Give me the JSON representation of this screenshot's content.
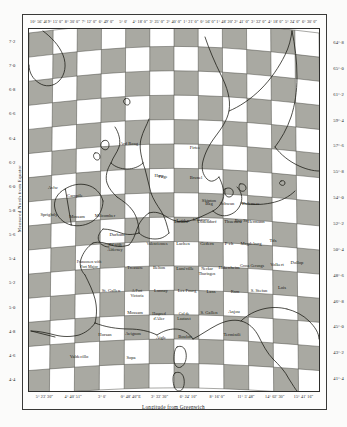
{
  "map": {
    "title": "Checkerboard graticule map of Western Europe",
    "projection_note": "curved graticule plate",
    "bottom_axis_caption": "Longitude from Greenwich",
    "left_axis_caption": "Measured North from Equator",
    "grid": {
      "columns": 12,
      "rows": 15,
      "checker": true
    },
    "colors": {
      "checker_fill": "#9a9a92",
      "coastline": "#15150f",
      "graticule": "#3d3d36",
      "paper": "#fdfdfc"
    }
  },
  "axes": {
    "top_ticks": [
      "10° 56' 40\"",
      "9° 15' 0\"",
      "8° 30' 0\"",
      "7° 12' 0\"",
      "6° 49' 0\"",
      "5° 0'",
      "4° 18' 0\"",
      "3° 25' 0\"",
      "2° 40' 0\"",
      "1° 21' 0\"",
      "0° 56' 0\"",
      "1° 48' 20\"",
      "2° 41' 0\"",
      "3° 32' 0\"",
      "4° 18' 0\"",
      "5° 24' 0\"",
      "6° 30' 0\""
    ],
    "bottom_ticks": [
      "5° 23' 30\"",
      "4° 40' 51\"",
      "3° 0'",
      "0° 48' 40\"E",
      "3° 33' 30\"",
      "6° 24' 10\"",
      "8° 16' 0\"",
      "11° 5' 48\"",
      "14° 02' 30\"",
      "15° 41' 16\""
    ],
    "left_ticks": [
      "7·2",
      "7·0",
      "6·8",
      "6·6",
      "6·4",
      "6·2",
      "6·0",
      "5·8",
      "5·6",
      "5·4",
      "5·2",
      "5·0",
      "4·8",
      "4·6",
      "4·4"
    ],
    "right_ticks": [
      "64°·8",
      "65°·0",
      "61°·2",
      "59°·4",
      "57°·6",
      "55°·8",
      "54°·0",
      "52°·2",
      "50°·4",
      "48°·6",
      "46°·8",
      "45°·0",
      "43°·2",
      "41°·4"
    ]
  },
  "places": [
    {
      "name": "Ard Roag",
      "x": 100,
      "y": 116
    },
    {
      "name": "Firtee",
      "x": 166,
      "y": 120
    },
    {
      "name": "Harp",
      "x": 130,
      "y": 148
    },
    {
      "name": "Fage",
      "x": 134,
      "y": 149
    },
    {
      "name": "Brunel",
      "x": 167,
      "y": 150
    },
    {
      "name": "Avlw",
      "x": 24,
      "y": 160
    },
    {
      "name": "Carnpile",
      "x": 46,
      "y": 168
    },
    {
      "name": "Skipton",
      "x": 180,
      "y": 173
    },
    {
      "name": "Sprightly",
      "x": 20,
      "y": 187
    },
    {
      "name": "Mossam",
      "x": 48,
      "y": 189
    },
    {
      "name": "Milcomber",
      "x": 76,
      "y": 188
    },
    {
      "name": "Jekktrow",
      "x": 172,
      "y": 192
    },
    {
      "name": "Bay St",
      "x": 212,
      "y": 193
    },
    {
      "name": "Leiden",
      "x": 154,
      "y": 193
    },
    {
      "name": "Bag",
      "x": 180,
      "y": 176
    },
    {
      "name": "Schwan",
      "x": 198,
      "y": 176
    },
    {
      "name": "Delemere",
      "x": 222,
      "y": 176
    },
    {
      "name": "Lachen",
      "x": 152,
      "y": 194
    },
    {
      "name": "Oldendorf",
      "x": 178,
      "y": 194
    },
    {
      "name": "Thuessen",
      "x": 204,
      "y": 194
    },
    {
      "name": "Hermann",
      "x": 227,
      "y": 194
    },
    {
      "name": "Durham",
      "x": 88,
      "y": 207
    },
    {
      "name": "Hd with Alderney",
      "x": 86,
      "y": 217
    },
    {
      "name": "Valenciennes",
      "x": 128,
      "y": 216
    },
    {
      "name": "Lachen",
      "x": 154,
      "y": 216
    },
    {
      "name": "Gedern",
      "x": 178,
      "y": 216
    },
    {
      "name": "P·ch",
      "x": 200,
      "y": 216
    },
    {
      "name": "Magdeburg",
      "x": 222,
      "y": 216
    },
    {
      "name": "Tds",
      "x": 244,
      "y": 213
    },
    {
      "name": "Franzosen with Port Major",
      "x": 60,
      "y": 234
    },
    {
      "name": "Treasure",
      "x": 106,
      "y": 240
    },
    {
      "name": "Belton",
      "x": 130,
      "y": 240
    },
    {
      "name": "Lunéville",
      "x": 156,
      "y": 241
    },
    {
      "name": "Neckar Thuringen",
      "x": 178,
      "y": 241
    },
    {
      "name": "Hakenheim",
      "x": 200,
      "y": 240
    },
    {
      "name": "Gross Gerungs",
      "x": 223,
      "y": 238
    },
    {
      "name": "Volkert",
      "x": 248,
      "y": 237
    },
    {
      "name": "Dollop",
      "x": 268,
      "y": 235
    },
    {
      "name": "St. Gallen",
      "x": 82,
      "y": 263
    },
    {
      "name": "A Fort Victoria",
      "x": 108,
      "y": 263
    },
    {
      "name": "Lannay",
      "x": 132,
      "y": 263
    },
    {
      "name": "Les Fourg",
      "x": 158,
      "y": 263
    },
    {
      "name": "Lans",
      "x": 182,
      "y": 264
    },
    {
      "name": "Ram",
      "x": 206,
      "y": 264
    },
    {
      "name": "S. Stefan",
      "x": 230,
      "y": 263
    },
    {
      "name": "Lois",
      "x": 253,
      "y": 260
    },
    {
      "name": "Mossam",
      "x": 106,
      "y": 285
    },
    {
      "name": "Haspred d'Alier",
      "x": 130,
      "y": 286
    },
    {
      "name": "Col de Lautaret",
      "x": 155,
      "y": 286
    },
    {
      "name": "S. Gallen",
      "x": 180,
      "y": 285
    },
    {
      "name": "Anjou",
      "x": 205,
      "y": 284
    },
    {
      "name": "Horsan",
      "x": 76,
      "y": 307
    },
    {
      "name": "Avignon",
      "x": 104,
      "y": 306
    },
    {
      "name": "Aigle",
      "x": 132,
      "y": 310
    },
    {
      "name": "Boulon",
      "x": 156,
      "y": 309
    },
    {
      "name": "Terminili",
      "x": 203,
      "y": 307
    },
    {
      "name": "Valdecillo",
      "x": 50,
      "y": 329
    },
    {
      "name": "Sopa",
      "x": 102,
      "y": 330
    }
  ]
}
